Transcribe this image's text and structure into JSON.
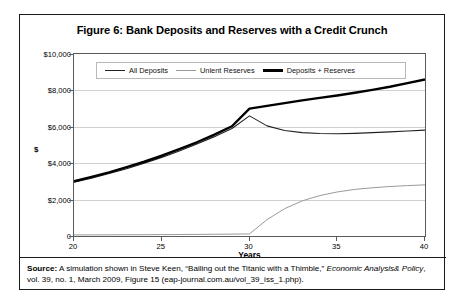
{
  "figure": {
    "title": "Figure 6: Bank Deposits and Reserves with a Credit Crunch",
    "source_label": "Source:",
    "source_text_1": " A simulation shown in Steve Keen, “Bailing out the Titanic with a Thimble,” ",
    "source_italic_1": "Economic Analysis",
    "source_italic_2": "& Policy",
    "source_text_2": ", vol. 39, no. 1, March 2009, Figure 15 (eap-journal.com.au/vol_39_iss_1.php)."
  },
  "chart_data": {
    "type": "line",
    "title": "Figure 6: Bank Deposits and Reserves with a Credit Crunch",
    "xlabel": "Years",
    "ylabel": "$",
    "xlim": [
      20,
      40
    ],
    "ylim": [
      0,
      10000
    ],
    "xticks": [
      20,
      25,
      30,
      35,
      40
    ],
    "xticklabels": [
      "20",
      "25",
      "30",
      "35",
      "40"
    ],
    "yticks": [
      0,
      2000,
      4000,
      6000,
      8000,
      10000
    ],
    "yticklabels": [
      "0",
      "$2,000",
      "$4,000",
      "$6,000",
      "$8,000",
      "$10,000"
    ],
    "grid": "horizontal",
    "legend_position": "top-left-inside",
    "x": [
      20,
      21,
      22,
      23,
      24,
      25,
      26,
      27,
      28,
      29,
      30,
      31,
      32,
      33,
      34,
      35,
      36,
      37,
      38,
      39,
      40
    ],
    "series": [
      {
        "name": "All Deposits",
        "color": "#222222",
        "width": 1.1,
        "values": [
          2950,
          3180,
          3430,
          3700,
          4000,
          4320,
          4670,
          5050,
          5460,
          5910,
          6600,
          6050,
          5800,
          5680,
          5630,
          5620,
          5640,
          5680,
          5720,
          5770,
          5820
        ]
      },
      {
        "name": "Unlent Reserves",
        "color": "#9a9a9a",
        "width": 1.0,
        "values": [
          60,
          62,
          65,
          68,
          72,
          76,
          82,
          88,
          95,
          104,
          115,
          900,
          1500,
          1930,
          2220,
          2420,
          2560,
          2650,
          2720,
          2770,
          2810
        ]
      },
      {
        "name": "Deposits + Reserves",
        "color": "#000000",
        "width": 2.4,
        "values": [
          3010,
          3250,
          3500,
          3780,
          4080,
          4410,
          4770,
          5150,
          5570,
          6030,
          7000,
          7150,
          7300,
          7450,
          7590,
          7720,
          7870,
          8030,
          8200,
          8400,
          8600
        ]
      }
    ]
  }
}
